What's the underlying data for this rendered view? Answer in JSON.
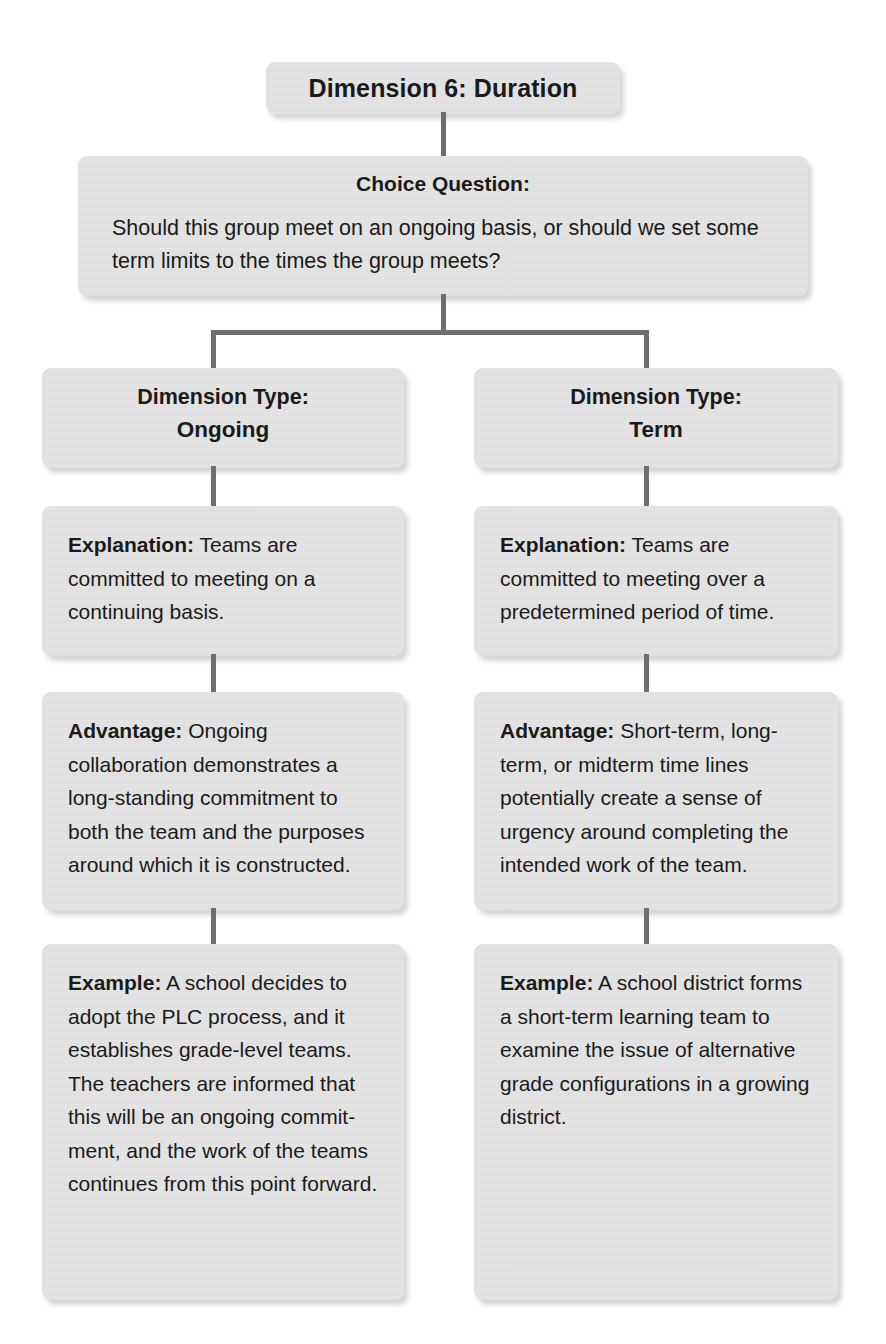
{
  "diagram": {
    "title": "Dimension 6: Duration",
    "question": {
      "heading": "Choice Question:",
      "text": "Should this group meet on an ongoing basis, or should we set some term limits to the times the group meets?"
    },
    "columns": [
      {
        "head_label": "Dimension Type:",
        "head_value": "Ongoing",
        "explanation_label": "Explanation:",
        "explanation_text": " Teams are committed to meeting on a continuing basis.",
        "advantage_label": "Advantage:",
        "advantage_text": " Ongoing collaboration demonstrates a long-standing commitment to both the team and the purposes around which it is constructed.",
        "example_label": "Example:",
        "example_text": " A school decides to adopt the PLC process, and it establishes grade-level teams. The teachers are informed that this will be an ongoing commit-ment, and the work of the teams continues from this point forward."
      },
      {
        "head_label": "Dimension Type:",
        "head_value": "Term",
        "explanation_label": "Explanation:",
        "explanation_text": " Teams are committed to meeting over a predetermined period of time.",
        "advantage_label": "Advantage:",
        "advantage_text": " Short-term, long-term, or midterm time lines potentially create a sense of urgency around completing the intended work of the team.",
        "example_label": "Example:",
        "example_text": " A school district forms a short-term learning team to examine the issue of alternative grade configurations in a growing district."
      }
    ],
    "colors": {
      "card_fill": "#e6e6e6",
      "connector": "#6e6e6e",
      "text": "#1a1a1a",
      "page_background": "#ffffff"
    }
  }
}
